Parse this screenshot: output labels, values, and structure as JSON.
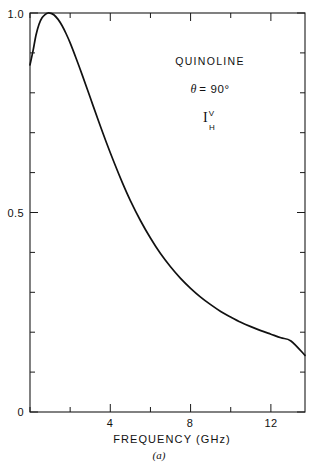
{
  "figure": {
    "caption": "(a)"
  },
  "annotations": {
    "sample_name": "QUINOLINE",
    "angle_symbol": "θ",
    "angle_equals": "= 90°",
    "intensity_symbol": "I",
    "intensity_superscript": "V",
    "intensity_subscript": "H"
  },
  "chart_data": {
    "type": "line",
    "title": "",
    "subtitle": "",
    "xlabel": "FREQUENCY (GHz)",
    "ylabel": "",
    "xlim": [
      0,
      13.7
    ],
    "ylim": [
      0,
      1.0
    ],
    "grid": false,
    "legend": null,
    "x_major_ticks": [
      4,
      8,
      12
    ],
    "x_major_tick_labels": [
      "4",
      "8",
      "12"
    ],
    "x_minor_tick_interval": 2,
    "y_major_ticks": [
      0,
      0.5,
      1.0
    ],
    "y_major_tick_labels": [
      "0",
      "0.5",
      "1.0"
    ],
    "y_minor_tick_interval": 0.1,
    "series": [
      {
        "name": "I_H^V depolarized intensity",
        "x": [
          0.0,
          0.15,
          0.3,
          0.45,
          0.6,
          0.75,
          0.9,
          1.05,
          1.2,
          1.4,
          1.6,
          1.8,
          2.0,
          2.3,
          2.6,
          3.0,
          3.4,
          3.8,
          4.2,
          4.6,
          5.0,
          5.5,
          6.0,
          6.5,
          7.0,
          7.5,
          8.0,
          8.5,
          9.0,
          9.5,
          10.0,
          10.5,
          11.0,
          11.5,
          12.0,
          12.5,
          13.0,
          13.7
        ],
        "y": [
          0.87,
          0.905,
          0.945,
          0.972,
          0.988,
          0.996,
          1.0,
          0.999,
          0.995,
          0.984,
          0.968,
          0.948,
          0.925,
          0.886,
          0.845,
          0.788,
          0.731,
          0.676,
          0.624,
          0.575,
          0.53,
          0.48,
          0.436,
          0.397,
          0.364,
          0.335,
          0.31,
          0.288,
          0.269,
          0.252,
          0.238,
          0.225,
          0.214,
          0.204,
          0.195,
          0.186,
          0.178,
          0.142
        ]
      }
    ],
    "notes": [
      "QUINOLINE",
      "θ = 90°",
      "I_H^V"
    ]
  },
  "colors": {
    "curve": "#111111",
    "axis": "#1a1a1a",
    "background": "#ffffff"
  }
}
